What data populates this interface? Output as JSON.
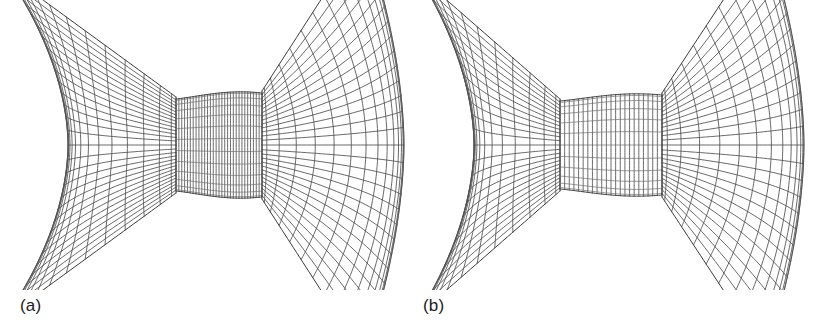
{
  "figure": {
    "kind": "computational-mesh-comparison",
    "background_color": "#ffffff",
    "line_color": "#4f4f4f",
    "label_color": "#1c1c1c",
    "width": 825,
    "height": 335
  },
  "panels": [
    {
      "id": "a",
      "label": "(a)",
      "x": 0,
      "y": 0,
      "width": 410,
      "height": 290,
      "description": "structured grid, narrow throat, fine streamwise spacing",
      "geometry": {
        "cy": 145,
        "throat": {
          "x_left": 176,
          "x_right": 262,
          "half_height_left": 46,
          "half_height_right": 52,
          "n_vertical": 30,
          "n_horizontal": 13,
          "bulge": 4
        },
        "left_lobe": {
          "x_outer": 6,
          "x_inner": 176,
          "waist_half_height": 18,
          "outer_half_height": 186,
          "n_radial": 30,
          "n_arc": 15,
          "concavity": 62,
          "arc_curve": 30
        },
        "right_lobe": {
          "x_inner": 262,
          "x_outer": 404,
          "waist_half_height": 54,
          "outer_half_height": 196,
          "n_radial": 28,
          "n_arc": 15,
          "convexity": 40,
          "arc_curve": -34
        }
      }
    },
    {
      "id": "b",
      "label": "(b)",
      "x": 412,
      "y": 0,
      "width": 413,
      "height": 290,
      "description": "structured grid, wider throat, coarser streamwise spacing",
      "geometry": {
        "cy": 145,
        "throat": {
          "x_left": 148,
          "x_right": 250,
          "half_height_left": 44,
          "half_height_right": 50,
          "n_vertical": 22,
          "n_horizontal": 12,
          "bulge": 4
        },
        "left_lobe": {
          "x_outer": 6,
          "x_inner": 148,
          "waist_half_height": 17,
          "outer_half_height": 184,
          "n_radial": 26,
          "n_arc": 14,
          "concavity": 56,
          "arc_curve": 28
        },
        "right_lobe": {
          "x_inner": 250,
          "x_outer": 392,
          "waist_half_height": 52,
          "outer_half_height": 194,
          "n_radial": 26,
          "n_arc": 14,
          "convexity": 38,
          "arc_curve": -32
        }
      }
    }
  ],
  "chart_data": {
    "type": "diagram",
    "title": "",
    "subtitle": "",
    "legend": [],
    "annotations": [
      "(a)",
      "(b)"
    ],
    "series": [
      {
        "name": "panel-a-mesh",
        "description": "two-lobe structured grid with narrow central throat"
      },
      {
        "name": "panel-b-mesh",
        "description": "two-lobe structured grid with wider central throat"
      }
    ]
  }
}
